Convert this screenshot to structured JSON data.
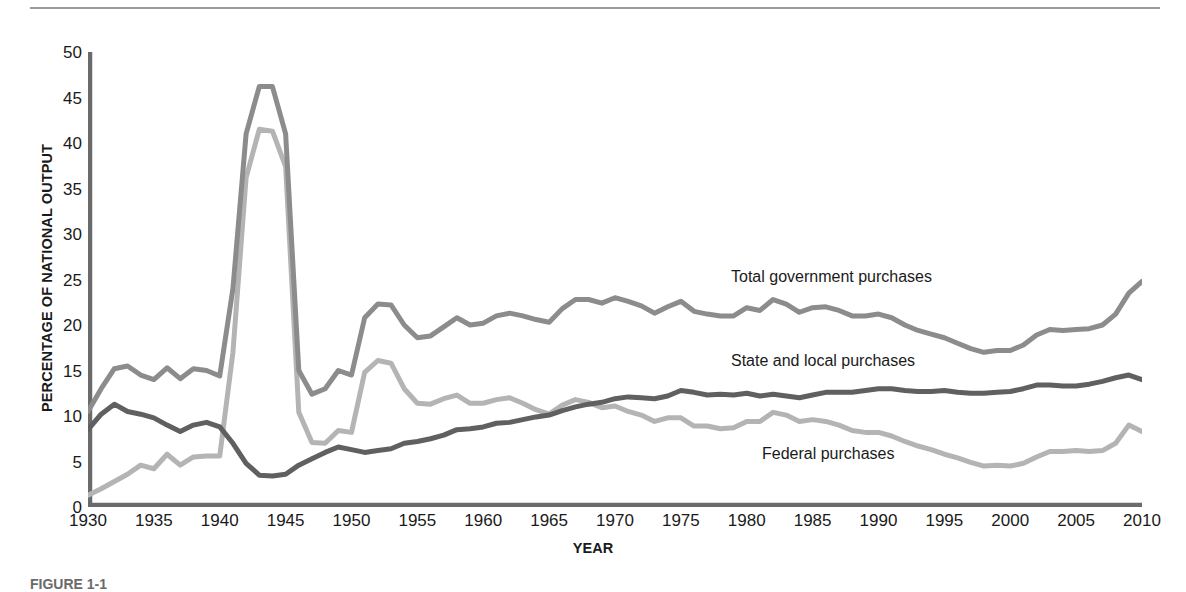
{
  "figure": {
    "caption": "FIGURE 1-1",
    "x_axis_title": "YEAR",
    "y_axis_title": "PERCENTAGE OF NATIONAL OUTPUT"
  },
  "annotations": [
    {
      "name": "total-government-purchases",
      "text": "Total government purchases"
    },
    {
      "name": "state-and-local-purchases",
      "text": "State and local purchases"
    },
    {
      "name": "federal-purchases",
      "text": "Federal purchases"
    }
  ],
  "colors": {
    "total": "#8c8c8c",
    "state_local": "#606060",
    "federal": "#b4b4b4",
    "axis": "#6b6b6b",
    "text": "#1a1a1a"
  },
  "chart_data": {
    "type": "line",
    "title": "",
    "subtitle": "",
    "xlabel": "YEAR",
    "ylabel": "PERCENTAGE OF NATIONAL OUTPUT",
    "xlim": [
      1930,
      2010
    ],
    "ylim": [
      0,
      50
    ],
    "xticks": [
      1930,
      1935,
      1940,
      1945,
      1950,
      1955,
      1960,
      1965,
      1970,
      1975,
      1980,
      1985,
      1990,
      1995,
      2000,
      2005,
      2010
    ],
    "yticks": [
      0,
      5,
      10,
      15,
      20,
      25,
      30,
      35,
      40,
      45,
      50
    ],
    "grid": false,
    "legend_position": "inline-annotations",
    "x": [
      1930,
      1931,
      1932,
      1933,
      1934,
      1935,
      1936,
      1937,
      1938,
      1939,
      1940,
      1941,
      1942,
      1943,
      1944,
      1945,
      1946,
      1947,
      1948,
      1949,
      1950,
      1951,
      1952,
      1953,
      1954,
      1955,
      1956,
      1957,
      1958,
      1959,
      1960,
      1961,
      1962,
      1963,
      1964,
      1965,
      1966,
      1967,
      1968,
      1969,
      1970,
      1971,
      1972,
      1973,
      1974,
      1975,
      1976,
      1977,
      1978,
      1979,
      1980,
      1981,
      1982,
      1983,
      1984,
      1985,
      1986,
      1987,
      1988,
      1989,
      1990,
      1991,
      1992,
      1993,
      1994,
      1995,
      1996,
      1997,
      1998,
      1999,
      2000,
      2001,
      2002,
      2003,
      2004,
      2005,
      2006,
      2007,
      2008,
      2009,
      2010
    ],
    "series": [
      {
        "name": "Total government purchases",
        "color": "#8c8c8c",
        "values": [
          10.5,
          13.0,
          15.2,
          15.5,
          14.5,
          14.0,
          15.3,
          14.1,
          15.2,
          15.0,
          14.4,
          24.0,
          41.0,
          46.2,
          46.2,
          41.0,
          15.0,
          12.4,
          13.0,
          15.0,
          14.5,
          20.8,
          22.3,
          22.2,
          20.0,
          18.6,
          18.8,
          19.8,
          20.8,
          20.0,
          20.2,
          21.0,
          21.3,
          21.0,
          20.6,
          20.3,
          21.8,
          22.8,
          22.8,
          22.4,
          23.0,
          22.6,
          22.1,
          21.3,
          22.0,
          22.6,
          21.5,
          21.2,
          21.0,
          21.0,
          21.9,
          21.6,
          22.8,
          22.3,
          21.4,
          21.9,
          22.0,
          21.6,
          21.0,
          21.0,
          21.2,
          20.8,
          20.0,
          19.4,
          19.0,
          18.6,
          18.0,
          17.4,
          17.0,
          17.2,
          17.2,
          17.8,
          18.9,
          19.5,
          19.4,
          19.5,
          19.6,
          20.0,
          21.2,
          23.5,
          24.8
        ]
      },
      {
        "name": "State and local purchases",
        "color": "#606060",
        "values": [
          8.5,
          10.2,
          11.3,
          10.5,
          10.2,
          9.8,
          9.0,
          8.3,
          9.0,
          9.3,
          8.8,
          7.0,
          4.8,
          3.5,
          3.4,
          3.6,
          4.6,
          5.3,
          6.0,
          6.6,
          6.3,
          6.0,
          6.2,
          6.4,
          7.0,
          7.2,
          7.5,
          7.9,
          8.5,
          8.6,
          8.8,
          9.2,
          9.3,
          9.6,
          9.9,
          10.1,
          10.6,
          11.0,
          11.3,
          11.5,
          11.9,
          12.1,
          12.0,
          11.9,
          12.2,
          12.8,
          12.6,
          12.3,
          12.4,
          12.3,
          12.5,
          12.2,
          12.4,
          12.2,
          12.0,
          12.3,
          12.6,
          12.6,
          12.6,
          12.8,
          13.0,
          13.0,
          12.8,
          12.7,
          12.7,
          12.8,
          12.6,
          12.5,
          12.5,
          12.6,
          12.7,
          13.0,
          13.4,
          13.4,
          13.3,
          13.3,
          13.5,
          13.8,
          14.2,
          14.5,
          14.0
        ]
      },
      {
        "name": "Federal purchases",
        "color": "#b4b4b4",
        "values": [
          1.3,
          2.0,
          2.8,
          3.6,
          4.6,
          4.2,
          5.8,
          4.6,
          5.5,
          5.6,
          5.6,
          17.0,
          36.2,
          41.5,
          41.3,
          37.4,
          10.4,
          7.1,
          7.0,
          8.4,
          8.2,
          14.8,
          16.1,
          15.8,
          13.0,
          11.4,
          11.3,
          11.9,
          12.3,
          11.4,
          11.4,
          11.8,
          12.0,
          11.4,
          10.7,
          10.2,
          11.2,
          11.8,
          11.5,
          10.9,
          11.1,
          10.5,
          10.1,
          9.4,
          9.8,
          9.8,
          8.9,
          8.9,
          8.6,
          8.7,
          9.4,
          9.4,
          10.4,
          10.1,
          9.4,
          9.6,
          9.4,
          9.0,
          8.4,
          8.2,
          8.2,
          7.8,
          7.2,
          6.7,
          6.3,
          5.8,
          5.4,
          4.9,
          4.5,
          4.6,
          4.5,
          4.8,
          5.5,
          6.1,
          6.1,
          6.2,
          6.1,
          6.2,
          7.0,
          9.0,
          8.3
        ]
      }
    ]
  }
}
